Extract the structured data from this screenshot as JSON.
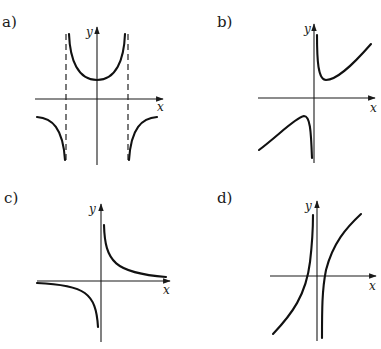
{
  "panels": [
    {
      "id": "a",
      "label": "a)",
      "x_axis_label": "x",
      "y_axis_label": "y",
      "description": "Even function with two vertical asymptotes (dashed); U-shaped branch above x-axis with minimum on y-axis; outer branches below x-axis"
    },
    {
      "id": "b",
      "label": "b)",
      "x_axis_label": "x",
      "y_axis_label": "y",
      "description": "Vertical asymptote at y-axis; right branch with local minimum above x-axis rising to oblique asymptote; left branch with local maximum below x-axis"
    },
    {
      "id": "c",
      "label": "c)",
      "x_axis_label": "x",
      "y_axis_label": "y",
      "description": "Hyperbola y = k/x type; branches in quadrants I and III approaching both axes"
    },
    {
      "id": "d",
      "label": "d)",
      "x_axis_label": "x",
      "y_axis_label": "y",
      "description": "Vertical asymptote near y-axis; two increasing branches each crossing x-axis once"
    }
  ],
  "colors": {
    "ink": "#111111",
    "background": "#ffffff"
  }
}
